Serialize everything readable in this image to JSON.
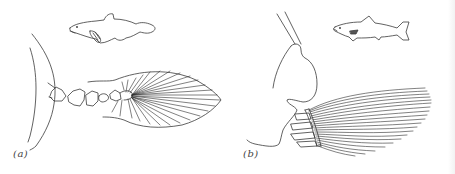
{
  "figure": {
    "panels": [
      {
        "id": "a",
        "label": "(a)",
        "subject": "lobe-finned fish (coelacanth) pectoral fin with bony axis"
      },
      {
        "id": "b",
        "label": "(b)",
        "subject": "ray-finned fish (salmon) pectoral fin with fan of rays"
      }
    ]
  },
  "colors": {
    "background": "#ffffff",
    "line": "#3a3a3a",
    "label": "#444444"
  }
}
